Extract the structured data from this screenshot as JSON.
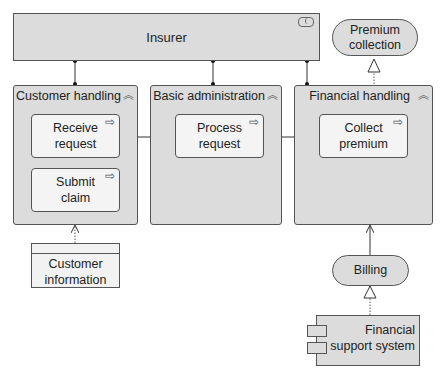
{
  "diagram": {
    "actor": {
      "label": "Insurer",
      "icon": "role-icon"
    },
    "groups": [
      {
        "id": "customer-handling",
        "label": "Customer handling",
        "icon": "function-icon"
      },
      {
        "id": "basic-administration",
        "label": "Basic administration",
        "icon": "function-icon"
      },
      {
        "id": "financial-handling",
        "label": "Financial handling",
        "icon": "function-icon"
      }
    ],
    "processes": [
      {
        "id": "receive-request",
        "label": "Receive request",
        "icon": "process-arrow-icon"
      },
      {
        "id": "submit-claim",
        "label": "Submit claim",
        "icon": "process-arrow-icon"
      },
      {
        "id": "process-request",
        "label": "Process request",
        "icon": "process-arrow-icon"
      },
      {
        "id": "collect-premium",
        "label": "Collect premium",
        "icon": "process-arrow-icon"
      }
    ],
    "services": [
      {
        "id": "premium-collection",
        "label": "Premium collection"
      },
      {
        "id": "billing",
        "label": "Billing"
      }
    ],
    "data_object": {
      "label": "Customer information"
    },
    "component": {
      "label": "Financial support system"
    },
    "glyphs": {
      "chevron": "︽",
      "arrow": "⇨"
    }
  }
}
